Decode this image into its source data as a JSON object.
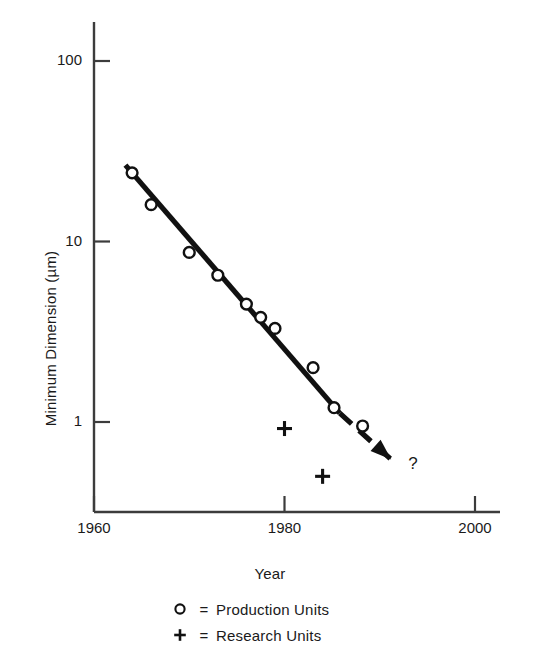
{
  "chart_data": {
    "type": "scatter",
    "title": "",
    "xlabel": "Year",
    "ylabel": "Minimum Dimension (µm)",
    "xlim": [
      1960,
      2002
    ],
    "ylim": [
      0.35,
      180
    ],
    "yscale": "log",
    "grid": false,
    "legend_position": "below-axes",
    "xticks": [
      {
        "value": 1960,
        "label": "1960"
      },
      {
        "value": 1980,
        "label": "1980"
      },
      {
        "value": 2000,
        "label": "2000"
      }
    ],
    "yticks": [
      {
        "value": 100,
        "label": "100"
      },
      {
        "value": 10,
        "label": "10"
      },
      {
        "value": 1,
        "label": "1"
      }
    ],
    "series": [
      {
        "name": "Production Units",
        "marker": "circle",
        "points": [
          {
            "x": 1964.0,
            "y": 24.0
          },
          {
            "x": 1966.0,
            "y": 16.0
          },
          {
            "x": 1970.0,
            "y": 8.7
          },
          {
            "x": 1973.0,
            "y": 6.5
          },
          {
            "x": 1976.0,
            "y": 4.5
          },
          {
            "x": 1977.5,
            "y": 3.8
          },
          {
            "x": 1979.0,
            "y": 3.3
          },
          {
            "x": 1983.0,
            "y": 2.0
          },
          {
            "x": 1985.2,
            "y": 1.2
          },
          {
            "x": 1988.2,
            "y": 0.95
          }
        ]
      },
      {
        "name": "Research Units",
        "marker": "plus",
        "points": [
          {
            "x": 1980.0,
            "y": 0.92
          },
          {
            "x": 1984.0,
            "y": 0.5
          }
        ]
      }
    ],
    "trend_line": {
      "solid_segment": {
        "x0": 1963.3,
        "y0": 26.5,
        "x1": 1985.8,
        "y1": 1.12
      },
      "dashed_segment": {
        "x0": 1985.8,
        "y0": 1.12,
        "x1": 1991.2,
        "y1": 0.62
      },
      "arrow_head": {
        "x": 1991.2,
        "y": 0.62
      },
      "annotation": "?"
    },
    "annotations": [
      {
        "text": "?",
        "x": 1993.0,
        "y": 0.55
      }
    ]
  },
  "legend": {
    "items": [
      {
        "marker_glyph": "○",
        "equals": "=",
        "label": "Production Units",
        "marker_name": "circle-marker"
      },
      {
        "marker_glyph": "＋",
        "equals": "=",
        "label": "Research Units",
        "marker_name": "plus-marker"
      }
    ]
  },
  "colors": {
    "ink": "#1a1a1a",
    "line": "#111111",
    "axis": "#4a4a4a",
    "background": "#ffffff"
  }
}
